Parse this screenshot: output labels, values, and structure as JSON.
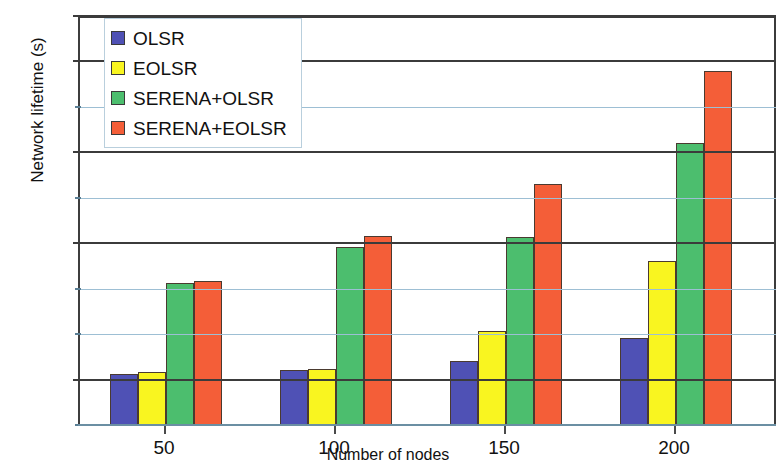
{
  "chart_data": {
    "type": "bar",
    "title": "",
    "xlabel": "Number of nodes",
    "ylabel": "Network lifetime (s)",
    "categories": [
      "50",
      "100",
      "150",
      "200"
    ],
    "series": [
      {
        "name": "OLSR",
        "color": "#4f51b5",
        "values": [
          112,
          122,
          140,
          192
        ]
      },
      {
        "name": "EOLSR",
        "color": "#f9f520",
        "values": [
          117,
          124,
          207,
          360
        ]
      },
      {
        "name": "SERENA+OLSR",
        "color": "#4cbe6e",
        "values": [
          312,
          392,
          414,
          620
        ]
      },
      {
        "name": "SERENA+EOLSR",
        "color": "#f45e38",
        "values": [
          318,
          415,
          530,
          780
        ]
      }
    ],
    "ylim": [
      0,
      900
    ],
    "yticks": [
      0,
      100,
      200,
      300,
      400,
      500,
      600,
      700,
      800,
      900
    ],
    "ytick_labels": [
      "0",
      "100",
      "200",
      "300",
      "400",
      "500",
      "600",
      "700",
      "800",
      "900"
    ],
    "major_gridlines": [
      100,
      400,
      600,
      800,
      900
    ],
    "grid": true,
    "legend_position": "top-left"
  }
}
